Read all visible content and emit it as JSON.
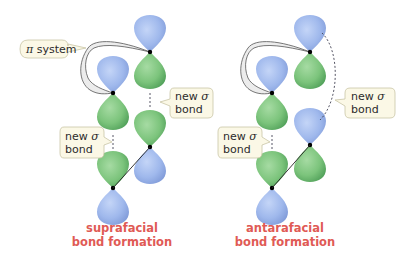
{
  "colors": {
    "blue_lobe": "#9fb8ec",
    "blue_lobe_dark": "#7f9ad8",
    "green_lobe": "#7cc47c",
    "green_lobe_dark": "#4f9f58",
    "caption": "#e05a55",
    "callout_fill": "#fbf8e6",
    "callout_stroke": "#c9c5a6",
    "ribbon_fill": "#ececec",
    "ribbon_stroke": "#555555"
  },
  "panels": [
    {
      "id": "suprafacial",
      "caption_line1": "suprafacial",
      "caption_line2": "bond formation",
      "pi_label_greek": "π",
      "pi_label_text": " system",
      "sigma_labels": [
        {
          "line1_text": "new ",
          "line1_greek": "σ",
          "line2": "bond"
        },
        {
          "line1_text": "new ",
          "line1_greek": "σ",
          "line2": "bond"
        }
      ]
    },
    {
      "id": "antarafacial",
      "caption_line1": "antarafacial",
      "caption_line2": "bond formation",
      "sigma_labels": [
        {
          "line1_text": "new ",
          "line1_greek": "σ",
          "line2": "bond"
        },
        {
          "line1_text": "new ",
          "line1_greek": "σ",
          "line2": "bond"
        }
      ]
    }
  ]
}
